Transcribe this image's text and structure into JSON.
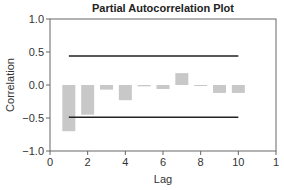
{
  "chart_data": {
    "type": "bar",
    "title": "Partial Autocorrelation Plot",
    "xlabel": "Lag",
    "ylabel": "Correlation",
    "categories": [
      1,
      2,
      3,
      4,
      5,
      6,
      7,
      8,
      9,
      10
    ],
    "values": [
      -0.7,
      -0.45,
      -0.07,
      -0.23,
      -0.02,
      -0.06,
      0.18,
      -0.01,
      -0.12,
      -0.12
    ],
    "confidence_bounds": {
      "upper": 0.44,
      "lower": -0.49,
      "x_start": 1.0,
      "x_end": 10.0
    },
    "xlim": [
      0,
      12
    ],
    "ylim": [
      -1.0,
      1.0
    ],
    "x_ticks": [
      "0",
      "2",
      "4",
      "6",
      "8",
      "10",
      "1"
    ],
    "y_ticks": [
      "1.0",
      "0.5",
      "0.0",
      "−0.5",
      "−1.0"
    ],
    "grid": false,
    "bar_color": "#c8c8c8",
    "line_color": "#222222"
  }
}
